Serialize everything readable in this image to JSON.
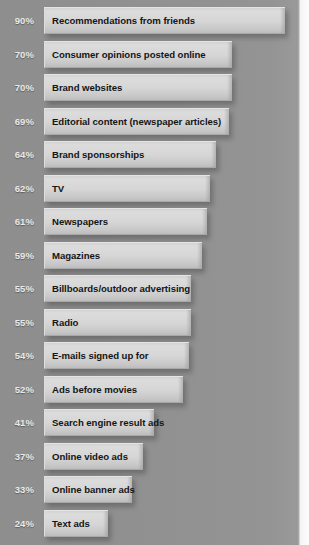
{
  "chart_data": {
    "type": "bar",
    "title": "",
    "subtitle": "",
    "xlabel": "",
    "ylabel": "",
    "orientation": "horizontal",
    "grid": false,
    "legend": false,
    "xlim": [
      0,
      100
    ],
    "value_suffix": "%",
    "categories": [
      "Recommendations from friends",
      "Consumer opinions posted online",
      "Brand websites",
      "Editorial content (newspaper articles)",
      "Brand sponsorships",
      "TV",
      "Newspapers",
      "Magazines",
      "Billboards/outdoor advertising",
      "Radio",
      "E-mails signed up for",
      "Ads before movies",
      "Search engine result ads",
      "Online video ads",
      "Online banner ads",
      "Text ads"
    ],
    "values": [
      90,
      70,
      70,
      69,
      64,
      62,
      61,
      59,
      55,
      55,
      54,
      52,
      41,
      37,
      33,
      24
    ],
    "value_labels": [
      "90%",
      "70%",
      "70%",
      "69%",
      "64%",
      "62%",
      "61%",
      "59%",
      "55%",
      "55%",
      "54%",
      "52%",
      "41%",
      "37%",
      "33%",
      "24%"
    ],
    "bars": [
      {
        "label": "Recommendations from friends",
        "value": 90,
        "value_label": "90%"
      },
      {
        "label": "Consumer opinions posted online",
        "value": 70,
        "value_label": "70%"
      },
      {
        "label": "Brand websites",
        "value": 70,
        "value_label": "70%"
      },
      {
        "label": "Editorial content (newspaper articles)",
        "value": 69,
        "value_label": "69%"
      },
      {
        "label": "Brand sponsorships",
        "value": 64,
        "value_label": "64%"
      },
      {
        "label": "TV",
        "value": 62,
        "value_label": "62%"
      },
      {
        "label": "Newspapers",
        "value": 61,
        "value_label": "61%"
      },
      {
        "label": "Magazines",
        "value": 59,
        "value_label": "59%"
      },
      {
        "label": "Billboards/outdoor advertising",
        "value": 55,
        "value_label": "55%"
      },
      {
        "label": "Radio",
        "value": 55,
        "value_label": "55%"
      },
      {
        "label": "E-mails signed up for",
        "value": 54,
        "value_label": "54%"
      },
      {
        "label": "Ads before movies",
        "value": 52,
        "value_label": "52%"
      },
      {
        "label": "Search engine result ads",
        "value": 41,
        "value_label": "41%"
      },
      {
        "label": "Online video ads",
        "value": 37,
        "value_label": "37%"
      },
      {
        "label": "Online banner ads",
        "value": 33,
        "value_label": "33%"
      },
      {
        "label": "Text ads",
        "value": 24,
        "value_label": "24%"
      }
    ]
  },
  "colors": {
    "background": "#919191",
    "background_edge": "#fdfdfd",
    "bar_light": "#dcdcdc",
    "bar_dark": "#bdbdbd",
    "bar_label_text": "#151515",
    "percent_label_text": "#e9e9e9"
  },
  "layout": {
    "bar_origin_x": 44,
    "bar_height": 27,
    "row_pitch": 33.5,
    "first_row_top": 7,
    "px_per_percent": 2.68
  }
}
